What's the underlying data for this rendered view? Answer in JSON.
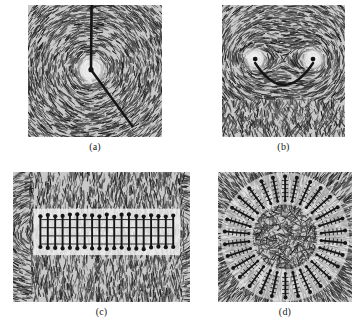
{
  "figure": {
    "background_color": "#ffffff",
    "panel_fill_color": "#c9c9c9",
    "line_color": "#141414",
    "defect_highlight_color": "#f2f2f2",
    "panel_count": 4
  },
  "panels": [
    {
      "id": "a",
      "caption": "(a)",
      "kind": "point-defect-with-line",
      "description": "Dark line entering from top edge terminating at a bright point defect, with a second shorter dark line leaving the defect toward the lower right.",
      "x": 28,
      "y": 5,
      "width": 134,
      "height": 132,
      "caption_x": 28,
      "caption_y": 141,
      "caption_width": 134,
      "defect": {
        "cx": 0.47,
        "cy": 0.49,
        "radius": 0.055
      },
      "lines": [
        {
          "name": "upper-line",
          "x1": 0.475,
          "y1": 0.0,
          "x2": 0.47,
          "y2": 0.49,
          "width": 2.6
        },
        {
          "name": "lower-line",
          "x1": 0.47,
          "y1": 0.49,
          "x2": 0.78,
          "y2": 0.92,
          "width": 2.4
        }
      ],
      "field_center": {
        "cx": 0.47,
        "cy": 0.49
      },
      "field_type": "radial-hedgehog"
    },
    {
      "id": "b",
      "caption": "(b)",
      "kind": "disclination-loop-arc",
      "description": "Two bright point defects joined by a dark U-shaped arc; the director field fans upward between the two defects.",
      "x": 222,
      "y": 5,
      "width": 123,
      "height": 132,
      "caption_x": 222,
      "caption_y": 141,
      "caption_width": 123,
      "defects": [
        {
          "name": "left-defect",
          "cx": 0.27,
          "cy": 0.41,
          "radius": 0.05
        },
        {
          "name": "right-defect",
          "cx": 0.74,
          "cy": 0.41,
          "radius": 0.05
        }
      ],
      "arc": {
        "x1": 0.27,
        "y1": 0.44,
        "x2": 0.74,
        "y2": 0.44,
        "sag": 0.33,
        "width": 2.6
      },
      "field_type": "fan-between-defects"
    },
    {
      "id": "c",
      "caption": "(c)",
      "kind": "ladder-slab",
      "description": "Horizontal ladder-like slab made of parallel vertical rungs capped with dots at both ends, embedded in a splayed director field.",
      "x": 13,
      "y": 172,
      "width": 177,
      "height": 130,
      "caption_x": 13,
      "caption_y": 306,
      "caption_width": 177,
      "ladder": {
        "x_start": 0.155,
        "x_end": 0.905,
        "y_top": 0.335,
        "y_bottom": 0.585,
        "rung_count": 19,
        "rung_width": 1.9,
        "dot_radius": 2.1,
        "rail_count": 4,
        "rail_width": 0.9
      },
      "field_type": "splay-around-slab"
    },
    {
      "id": "d",
      "caption": "(d)",
      "kind": "ladder-ring",
      "description": "Ring of ladder segments arranged radially around a central disc, each segment pointing outward with dots on the outer ends.",
      "x": 218,
      "y": 172,
      "width": 134,
      "height": 130,
      "caption_x": 218,
      "caption_y": 306,
      "caption_width": 134,
      "ring": {
        "cx": 0.5,
        "cy": 0.5,
        "inner_radius": 0.28,
        "outer_radius": 0.465,
        "segment_count": 30,
        "rung_count_per_segment": 5,
        "segment_width": 1.8,
        "dot_radius": 2.0
      },
      "field_type": "radial-around-ring"
    }
  ]
}
